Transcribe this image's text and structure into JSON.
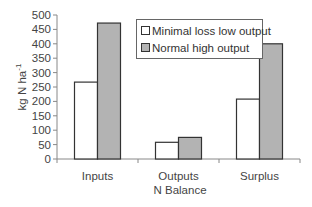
{
  "chart_data": {
    "type": "bar",
    "title": "",
    "xlabel": "N Balance",
    "ylabel": "kg N ha⁻¹",
    "ylim": [
      0,
      500
    ],
    "yticks": [
      0,
      50,
      100,
      150,
      200,
      250,
      300,
      350,
      400,
      450,
      500
    ],
    "grid": false,
    "legend_position": "upper-center-right",
    "categories": [
      "Inputs",
      "Outputs",
      "Surplus"
    ],
    "series": [
      {
        "name": "Minimal loss low output",
        "color": "#ffffff",
        "values": [
          267,
          58,
          208
        ]
      },
      {
        "name": "Normal high output",
        "color": "#b3b3b3",
        "values": [
          472,
          75,
          400
        ]
      }
    ]
  },
  "legend": {
    "items": [
      {
        "label": "Minimal loss low output",
        "color": "#ffffff"
      },
      {
        "label": "Normal high output",
        "color": "#b3b3b3"
      }
    ]
  }
}
